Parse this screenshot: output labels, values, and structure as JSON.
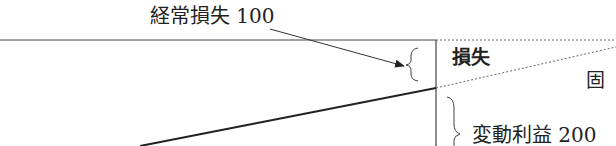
{
  "diagram": {
    "labels": {
      "ordinary_loss": "経常損失 100",
      "loss": "損失",
      "fixed": "固",
      "variable_profit": "変動利益 200"
    },
    "colors": {
      "line": "#222222",
      "dotted": "#555555"
    }
  }
}
